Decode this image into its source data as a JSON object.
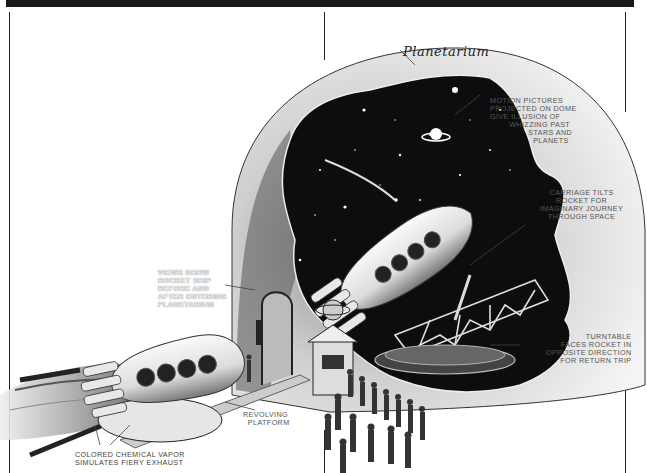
{
  "figure": {
    "title": "Planetarium",
    "colors": {
      "ink": "#1a1a1a",
      "paper": "#ffffff",
      "dome": "#f2f2f2",
      "sky": "#0d0d0d",
      "label": "#555555"
    },
    "labels": {
      "motion_pictures": "MOTION PICTURES\nPROJECTED ON DOME\nGIVE ILLUSION OF\n        WHIZZING PAST\n                STARS AND\n                  PLANETS",
      "carriage_tilts": "CARRIAGE TILTS\nROCKET FOR\nIMAGINARY JOURNEY\nTHROUGH SPACE",
      "turntable": "TURNTABLE\nFACES ROCKET IN\nOPPOSITE DIRECTION\nFOR RETURN TRIP",
      "views_show": "VIEWS SHOW\nROCKET SHIP\nBEFORE AND\nAFTER ENTERING\nPLANETARIUM",
      "revolving_platform": "REVOLVING\n  PLATFORM",
      "colored_vapor": "COLORED CHEMICAL VAPOR\nSIMULATES FIERY EXHAUST"
    },
    "elements": [
      "planetarium-dome",
      "starfield",
      "saturn-planet",
      "comet",
      "rocket-inside",
      "tilting-carriage",
      "turntable",
      "entrance-arch",
      "ticket-booth",
      "rocket-outside",
      "revolving-platform",
      "exhaust-vapor",
      "crowd"
    ]
  }
}
